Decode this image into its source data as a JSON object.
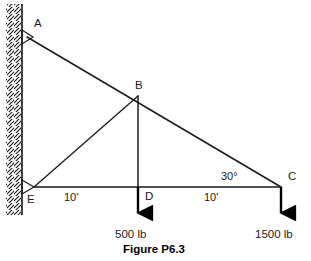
{
  "figure": {
    "caption": "Figure P6.3",
    "nodes": [
      {
        "id": "A",
        "label": "A",
        "x": 22,
        "y": 37,
        "label_x": 34,
        "label_y": 18
      },
      {
        "id": "B",
        "label": "B",
        "x": 138,
        "y": 96,
        "label_x": 138,
        "label_y": 80
      },
      {
        "id": "C",
        "label": "C",
        "x": 281,
        "y": 187,
        "label_x": 288,
        "label_y": 172
      },
      {
        "id": "D",
        "label": "D",
        "x": 138,
        "y": 187,
        "label_x": 145,
        "label_y": 191
      },
      {
        "id": "E",
        "label": "E",
        "x": 34,
        "y": 187,
        "label_x": 29,
        "label_y": 192
      }
    ],
    "members": [
      {
        "name": "A-C",
        "from": "A",
        "to": "C"
      },
      {
        "name": "E-C",
        "from": "E",
        "to": "C"
      },
      {
        "name": "E-B",
        "from": "E",
        "to": "B"
      },
      {
        "name": "B-D",
        "from": "B",
        "to": "D"
      }
    ],
    "dimensions": [
      {
        "name": "E-D-span",
        "value": "10'",
        "x": 68,
        "y": 195
      },
      {
        "name": "D-C-span",
        "value": "10'",
        "x": 208,
        "y": 195
      }
    ],
    "angles": [
      {
        "name": "angle-at-C",
        "value": "30°",
        "x": 228,
        "y": 172
      }
    ],
    "loads": [
      {
        "name": "load-at-D",
        "value": "500 lb",
        "arrow_x": 138,
        "arrow_y0": 187,
        "arrow_y1": 219,
        "label_x": 138,
        "label_y": 232
      },
      {
        "name": "load-at-C",
        "value": "1500 lb",
        "arrow_x": 281,
        "arrow_y0": 187,
        "arrow_y1": 219,
        "label_x": 281,
        "label_y": 232
      }
    ],
    "wall": {
      "name": "fixed-wall",
      "x": 22,
      "y_top": 4,
      "y_bottom": 215,
      "hatch_label": "hatched-wall"
    },
    "supports": [
      {
        "name": "pin-support-A",
        "x": 22,
        "y": 37
      },
      {
        "name": "pin-support-E",
        "x": 22,
        "y": 187
      }
    ],
    "caption_pos": {
      "x": 155,
      "y": 246
    },
    "colors": {
      "line": "#1a1a1a",
      "arrow": "#000000",
      "text": "#1a1a1a",
      "background": "#ffffff"
    }
  }
}
